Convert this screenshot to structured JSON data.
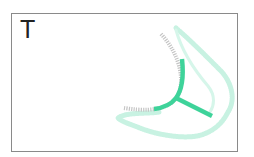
{
  "diagram": {
    "label": "T",
    "colors": {
      "frame": "#8a8a8a",
      "dotted_arc": "#c4c4c4",
      "accent_arc": "#3ed39a",
      "outline_shape": "#c8f2e2"
    }
  }
}
